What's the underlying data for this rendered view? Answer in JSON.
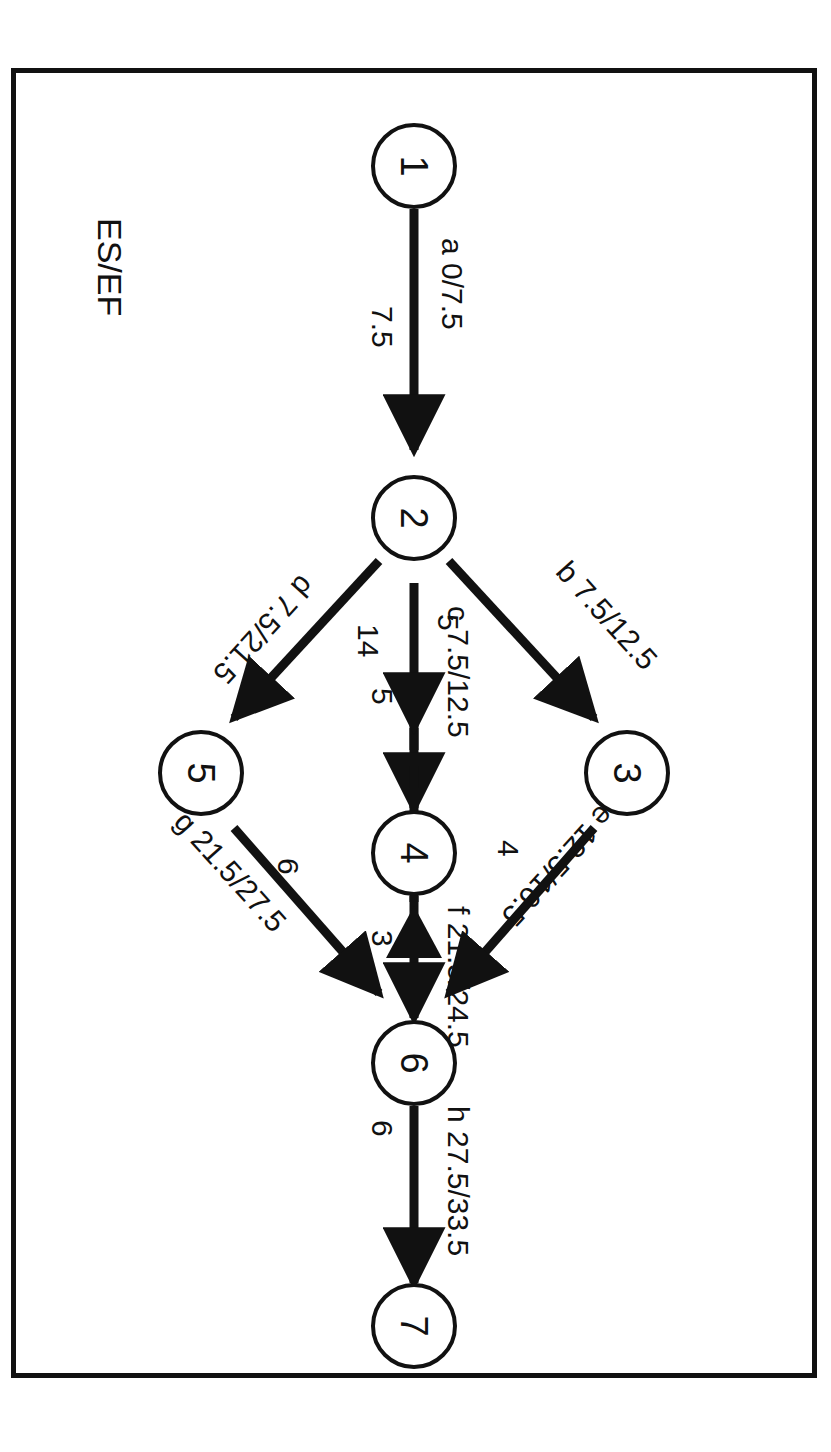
{
  "figure": {
    "type": "activity-on-arrow-network",
    "orientation": "rotated-90-clockwise",
    "legend_label": "ES/EF"
  },
  "nodes": [
    {
      "id": "1",
      "label": "1"
    },
    {
      "id": "2",
      "label": "2"
    },
    {
      "id": "3",
      "label": "3"
    },
    {
      "id": "4",
      "label": "4"
    },
    {
      "id": "5",
      "label": "5"
    },
    {
      "id": "6",
      "label": "6"
    },
    {
      "id": "7",
      "label": "7"
    }
  ],
  "edges": [
    {
      "id": "a",
      "from": "1",
      "to": "2",
      "activity": "a",
      "es_ef": "0/7.5",
      "label": "a  0/7.5",
      "duration": "7.5",
      "style": "solid"
    },
    {
      "id": "b",
      "from": "2",
      "to": "3",
      "activity": "b",
      "es_ef": "7.5/12.5",
      "label": "b  7.5/12.5",
      "duration": "5",
      "style": "solid"
    },
    {
      "id": "c",
      "from": "2",
      "to": "4",
      "activity": "c",
      "es_ef": "7.5/12.5",
      "label": "c  7.5/12.5",
      "duration": "5",
      "style": "solid"
    },
    {
      "id": "d",
      "from": "2",
      "to": "5",
      "activity": "d",
      "es_ef": "7.5/21.5",
      "label": "d  7.5/21.5",
      "duration": "14",
      "style": "solid"
    },
    {
      "id": "e",
      "from": "3",
      "to": "6",
      "activity": "e",
      "es_ef": "12.5/16.5",
      "label": "e  12.5/16.5",
      "duration": "4",
      "style": "solid"
    },
    {
      "id": "f",
      "from": "4",
      "to": "6",
      "activity": "f",
      "es_ef": "21.5/24.5",
      "label": "f  21.5/24.5",
      "duration": "3",
      "style": "solid"
    },
    {
      "id": "g",
      "from": "5",
      "to": "6",
      "activity": "g",
      "es_ef": "21.5/27.5",
      "label": "g  21.5/27.5",
      "duration": "6",
      "style": "solid"
    },
    {
      "id": "h",
      "from": "6",
      "to": "7",
      "activity": "h",
      "es_ef": "27.5/33.5",
      "label": "h  27.5/33.5",
      "duration": "6",
      "style": "solid"
    },
    {
      "id": "dummy",
      "from": "5",
      "to": "4",
      "activity": "",
      "es_ef": "",
      "label": "",
      "duration": "",
      "style": "dashed"
    }
  ]
}
